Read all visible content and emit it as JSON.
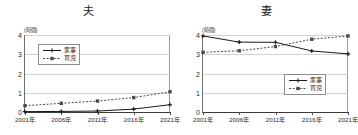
{
  "chart_data": [
    {
      "type": "line",
      "title": "夫",
      "xlabel": "",
      "ylabel": "",
      "unit_label": "(時間)",
      "categories": [
        "2001年",
        "2006年",
        "2011年",
        "2016年",
        "2021年"
      ],
      "yticks": [
        0,
        1,
        2,
        3,
        4
      ],
      "ylim": [
        0,
        4
      ],
      "grid": true,
      "legend_position": "upper-left",
      "series": [
        {
          "name": "家事",
          "style": "solid",
          "marker": "cross",
          "color": "#1a1a1a",
          "values": [
            0.02,
            0.03,
            0.05,
            0.15,
            0.38
          ]
        },
        {
          "name": "育児",
          "style": "dashed",
          "marker": "square",
          "color": "#4a4a4a",
          "values": [
            0.33,
            0.45,
            0.57,
            0.75,
            1.05
          ]
        }
      ]
    },
    {
      "type": "line",
      "title": "妻",
      "xlabel": "",
      "ylabel": "",
      "unit_label": "(時間)",
      "categories": [
        "2001年",
        "2006年",
        "2011年",
        "2016年",
        "2021年"
      ],
      "yticks": [
        0,
        1,
        2,
        3,
        4
      ],
      "ylim": [
        0,
        4
      ],
      "grid": true,
      "legend_position": "lower-right",
      "series": [
        {
          "name": "家事",
          "style": "solid",
          "marker": "cross",
          "color": "#1a1a1a",
          "values": [
            3.95,
            3.63,
            3.62,
            3.17,
            3.02
          ]
        },
        {
          "name": "育児",
          "style": "dashed",
          "marker": "square",
          "color": "#4a4a4a",
          "values": [
            3.1,
            3.18,
            3.4,
            3.78,
            3.95
          ]
        }
      ]
    }
  ]
}
